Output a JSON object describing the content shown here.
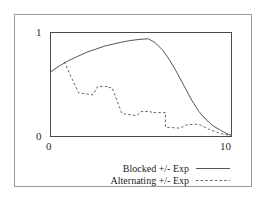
{
  "chart_data": {
    "type": "line",
    "title": "",
    "subtitle": "",
    "xlabel": "",
    "ylabel": "",
    "xlim": [
      0,
      10
    ],
    "ylim": [
      0,
      1
    ],
    "xticks": [
      0,
      10
    ],
    "xticklabels": [
      "0",
      "10"
    ],
    "yticks": [
      0,
      1
    ],
    "yticklabels": [
      "0",
      "1"
    ],
    "grid": false,
    "legend_position": "below-plot-right",
    "series": [
      {
        "name": "Blocked +/- Exp",
        "style": "solid",
        "color": "#555555",
        "x": [
          0.0,
          0.5,
          1.0,
          1.5,
          2.0,
          2.5,
          3.0,
          3.5,
          4.0,
          4.5,
          5.0,
          5.4,
          5.8,
          6.2,
          6.6,
          7.0,
          7.4,
          7.8,
          8.2,
          8.6,
          9.0,
          9.4,
          9.7,
          10.0
        ],
        "y": [
          0.62,
          0.68,
          0.73,
          0.77,
          0.81,
          0.84,
          0.87,
          0.89,
          0.91,
          0.925,
          0.935,
          0.94,
          0.9,
          0.83,
          0.73,
          0.61,
          0.48,
          0.35,
          0.24,
          0.16,
          0.1,
          0.06,
          0.03,
          0.01
        ]
      },
      {
        "name": "Alternating +/- Exp",
        "style": "dashed",
        "color": "#666666",
        "x": [
          0.75,
          1.55,
          1.55,
          2.35,
          2.35,
          2.6,
          3.15,
          3.15,
          3.4,
          3.95,
          3.95,
          4.75,
          4.75,
          5.0,
          5.55,
          5.55,
          6.35,
          6.35,
          7.15,
          7.5,
          7.95,
          8.3,
          8.75,
          9.2,
          9.6,
          10.0
        ],
        "y": [
          0.72,
          0.42,
          0.42,
          0.4,
          0.4,
          0.48,
          0.48,
          0.47,
          0.47,
          0.22,
          0.22,
          0.2,
          0.2,
          0.24,
          0.24,
          0.23,
          0.23,
          0.09,
          0.08,
          0.11,
          0.12,
          0.11,
          0.07,
          0.04,
          0.02,
          0.01
        ]
      }
    ]
  },
  "axes": {
    "y_top_label": "1",
    "y_bottom_label": "0",
    "x_left_label": "0",
    "x_right_label": "10"
  },
  "legend": {
    "entries": [
      {
        "label": "Blocked +/- Exp",
        "style": "solid"
      },
      {
        "label": "Alternating +/- Exp",
        "style": "dashed"
      }
    ]
  },
  "colors": {
    "outer_frame": "#9a9a9a",
    "plot_frame": "#4a4a4a",
    "solid_line": "#555555",
    "dashed_line": "#666666",
    "text": "#1d1d1d",
    "background": "#ffffff"
  }
}
